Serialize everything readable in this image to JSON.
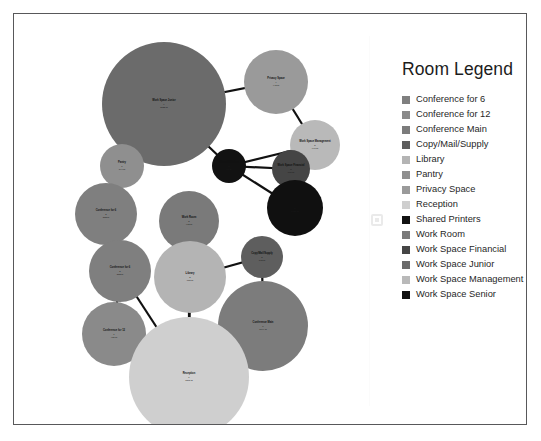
{
  "figure": {
    "background_color": "#ffffff",
    "border_color": "#58585a"
  },
  "legend": {
    "title": "Room Legend",
    "items": [
      {
        "label": "Conference for 6",
        "color": "#7f7f7f"
      },
      {
        "label": "Conference for 12",
        "color": "#8a8a8a"
      },
      {
        "label": "Conference Main",
        "color": "#7c7c7c"
      },
      {
        "label": "Copy/Mail/Supply",
        "color": "#5e5e5e"
      },
      {
        "label": "Library",
        "color": "#b4b4b4"
      },
      {
        "label": "Pantry",
        "color": "#8f8f8f"
      },
      {
        "label": "Privacy Space",
        "color": "#9a9a9a"
      },
      {
        "label": "Reception",
        "color": "#cfcfcf"
      },
      {
        "label": "Shared Printers",
        "color": "#121212"
      },
      {
        "label": "Work Room",
        "color": "#7a7a7a"
      },
      {
        "label": "Work Space Financial",
        "color": "#454545"
      },
      {
        "label": "Work Space Junior",
        "color": "#6b6b6b"
      },
      {
        "label": "Work Space Management",
        "color": "#b9b9b9"
      },
      {
        "label": "Work Space Senior",
        "color": "#101010"
      }
    ]
  },
  "marker": {
    "name": "small-square-marker"
  },
  "chart_data": {
    "type": "scatter",
    "title": "",
    "xlabel": "",
    "ylabel": "",
    "grid": false,
    "legend_position": "right",
    "note": "Bubble / node-link diagram of office rooms; bubble area encodes room area, links encode adjacency.",
    "nodes": [
      {
        "id": "work-space-junior",
        "label": "Work Space Junior",
        "sub": "9\n3122 sf",
        "cx": 150,
        "cy": 90,
        "r": 62,
        "color": "#6b6b6b"
      },
      {
        "id": "privacy-space",
        "label": "Privacy Space",
        "sub": "4\n445 sf",
        "cx": 262,
        "cy": 68,
        "r": 32,
        "color": "#9a9a9a"
      },
      {
        "id": "work-space-management",
        "label": "Work Space Management",
        "sub": "5\n996 sf",
        "cx": 301,
        "cy": 131,
        "r": 25,
        "color": "#b9b9b9"
      },
      {
        "id": "work-space-financial",
        "label": "Work Space Financial",
        "sub": "3\n606 sf",
        "cx": 277,
        "cy": 155,
        "r": 19,
        "color": "#454545"
      },
      {
        "id": "shared-printers",
        "label": "Shared Printers",
        "sub": "2\n96 sf",
        "cx": 215,
        "cy": 152,
        "r": 17,
        "color": "#121212"
      },
      {
        "id": "work-space-senior",
        "label": "Work Space Senior",
        "sub": "6\n1480 sf",
        "cx": 281,
        "cy": 194,
        "r": 28,
        "color": "#101010"
      },
      {
        "id": "pantry",
        "label": "Pantry",
        "sub": "1\n194 sf",
        "cx": 108,
        "cy": 152,
        "r": 22,
        "color": "#8f8f8f"
      },
      {
        "id": "conference-for-6",
        "label": "Conference for 6",
        "sub": "2\n352 sf",
        "cx": 92,
        "cy": 200,
        "r": 31,
        "color": "#7f7f7f"
      },
      {
        "id": "work-room",
        "label": "Work Room",
        "sub": "3\n415 sf",
        "cx": 175,
        "cy": 207,
        "r": 30,
        "color": "#7a7a7a"
      },
      {
        "id": "copy-mail-supply",
        "label": "Copy/Mail/Supply",
        "sub": "2\n165 sf",
        "cx": 248,
        "cy": 243,
        "r": 21,
        "color": "#5e5e5e"
      },
      {
        "id": "library",
        "label": "Library",
        "sub": "2\n651 sf",
        "cx": 176,
        "cy": 263,
        "r": 36,
        "color": "#b4b4b4"
      },
      {
        "id": "conference-for-6b",
        "label": "Conference for 6",
        "sub": "2\n352 sf",
        "cx": 106,
        "cy": 257,
        "r": 31,
        "color": "#7f7f7f"
      },
      {
        "id": "conference-for-12",
        "label": "Conference for 12",
        "sub": "1\n420 sf",
        "cx": 100,
        "cy": 320,
        "r": 32,
        "color": "#8a8a8a"
      },
      {
        "id": "conference-main",
        "label": "Conference Main",
        "sub": "1\n1044 sf",
        "cx": 249,
        "cy": 312,
        "r": 45,
        "color": "#7c7c7c"
      },
      {
        "id": "reception",
        "label": "Reception",
        "sub": "1\n1868 sf",
        "cx": 175,
        "cy": 363,
        "r": 60,
        "color": "#cfcfcf"
      }
    ],
    "edges": [
      [
        "work-space-junior",
        "privacy-space"
      ],
      [
        "work-space-junior",
        "shared-printers"
      ],
      [
        "work-space-junior",
        "pantry"
      ],
      [
        "privacy-space",
        "work-space-management"
      ],
      [
        "shared-printers",
        "work-space-management"
      ],
      [
        "shared-printers",
        "work-space-financial"
      ],
      [
        "shared-printers",
        "work-space-senior"
      ],
      [
        "work-space-management",
        "work-space-senior"
      ],
      [
        "work-space-financial",
        "work-space-senior"
      ],
      [
        "pantry",
        "conference-for-6"
      ],
      [
        "conference-for-6",
        "conference-for-6b"
      ],
      [
        "conference-for-6b",
        "conference-for-12"
      ],
      [
        "work-room",
        "library"
      ],
      [
        "library",
        "copy-mail-supply"
      ],
      [
        "copy-mail-supply",
        "conference-main"
      ],
      [
        "reception",
        "work-room"
      ],
      [
        "reception",
        "conference-for-6b"
      ],
      [
        "reception",
        "conference-for-12"
      ],
      [
        "reception",
        "conference-main"
      ],
      [
        "reception",
        "library"
      ]
    ]
  }
}
